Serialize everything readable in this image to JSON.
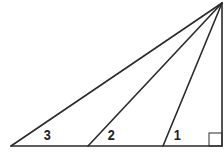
{
  "diagram": {
    "type": "geometry-right-triangle-with-cevians",
    "stroke_color": "#2a2a2a",
    "background": "#ffffff",
    "vertices": {
      "apex": {
        "x": 222,
        "y": 3
      },
      "bottom_left": {
        "x": 11,
        "y": 146
      },
      "right_angle": {
        "x": 222,
        "y": 146
      }
    },
    "cevian_feet": [
      {
        "x": 88,
        "y": 146
      },
      {
        "x": 163,
        "y": 146
      }
    ],
    "right_angle_marker": {
      "x": 209,
      "y": 133,
      "size": 13
    },
    "angle_labels": [
      {
        "text": "3",
        "x": 43,
        "y": 127
      },
      {
        "text": "2",
        "x": 107,
        "y": 127
      },
      {
        "text": "1",
        "x": 173,
        "y": 127
      }
    ]
  }
}
